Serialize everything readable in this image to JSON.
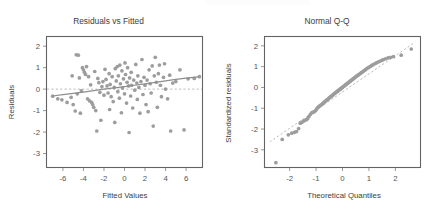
{
  "figure": {
    "background": "#ffffff",
    "point_color": "#9d9d9d",
    "line_color": "#8e8e8e",
    "ref_line_color": "#b4b4b4",
    "frame_color": "#636363"
  },
  "chart_data": [
    {
      "type": "scatter",
      "panel": "left",
      "title": "Residuals vs Fitted",
      "xlabel": "Fitted Values",
      "ylabel": "Residuals",
      "xlim": [
        -7.6,
        7.6
      ],
      "ylim": [
        -3.65,
        2.45
      ],
      "xticks": [
        -6,
        -4,
        -2,
        0,
        2,
        4,
        6
      ],
      "xtick_labels": [
        "-6",
        "-4",
        "-2",
        "0",
        "2",
        "4",
        "6"
      ],
      "yticks": [
        2,
        1,
        0,
        -1,
        -2,
        -3
      ],
      "ytick_labels": [
        "2",
        "1",
        "0",
        "-1",
        "-2",
        "-3"
      ],
      "grid": false,
      "legend": null,
      "reference_line": {
        "type": "horizontal",
        "y": 0,
        "style": "dashed"
      },
      "trend_line": {
        "type": "loess",
        "style": "solid",
        "x": [
          -7.0,
          -6.0,
          -5.0,
          -4.0,
          -3.0,
          -2.0,
          -1.0,
          0.0,
          1.0,
          2.0,
          3.0,
          4.0,
          5.0,
          6.0,
          7.2
        ],
        "y": [
          -0.32,
          -0.26,
          -0.2,
          -0.14,
          -0.07,
          0.0,
          0.06,
          0.12,
          0.18,
          0.24,
          0.31,
          0.38,
          0.45,
          0.51,
          0.57
        ]
      },
      "points": [
        [
          -7.0,
          -0.33
        ],
        [
          -6.5,
          -0.45
        ],
        [
          -6.1,
          -0.5
        ],
        [
          -5.6,
          -0.62
        ],
        [
          -5.2,
          -0.38
        ],
        [
          -5.1,
          0.62
        ],
        [
          -5.0,
          -0.72
        ],
        [
          -4.8,
          -1.02
        ],
        [
          -4.7,
          1.6
        ],
        [
          -4.6,
          -0.22
        ],
        [
          -4.5,
          1.58
        ],
        [
          -4.4,
          0.52
        ],
        [
          -4.3,
          -1.12
        ],
        [
          -4.2,
          -0.08
        ],
        [
          -4.1,
          1.0
        ],
        [
          -4.0,
          0.9
        ],
        [
          -3.9,
          0.78
        ],
        [
          -3.8,
          0.68
        ],
        [
          -3.7,
          1.05
        ],
        [
          -3.6,
          -0.45
        ],
        [
          -3.5,
          0.58
        ],
        [
          -3.4,
          -0.55
        ],
        [
          -3.3,
          0.2
        ],
        [
          -3.2,
          -0.62
        ],
        [
          -3.1,
          -0.72
        ],
        [
          -3.0,
          -0.85
        ],
        [
          -2.9,
          0.82
        ],
        [
          -2.8,
          -1.0
        ],
        [
          -2.7,
          -1.95
        ],
        [
          -2.6,
          0.5
        ],
        [
          -2.5,
          0.3
        ],
        [
          -2.4,
          -0.15
        ],
        [
          -2.3,
          -1.45
        ],
        [
          -2.2,
          0.12
        ],
        [
          -2.1,
          0.35
        ],
        [
          -2.0,
          -0.28
        ],
        [
          -1.9,
          0.92
        ],
        [
          -1.8,
          0.45
        ],
        [
          -1.7,
          0.15
        ],
        [
          -1.6,
          -0.18
        ],
        [
          -1.5,
          0.72
        ],
        [
          -1.45,
          -0.95
        ],
        [
          -1.4,
          0.22
        ],
        [
          -1.3,
          -0.35
        ],
        [
          -1.2,
          0.58
        ],
        [
          -1.1,
          -0.58
        ],
        [
          -1.0,
          0.08
        ],
        [
          -0.95,
          -1.55
        ],
        [
          -0.9,
          0.95
        ],
        [
          -0.8,
          0.38
        ],
        [
          -0.7,
          1.05
        ],
        [
          -0.65,
          -0.12
        ],
        [
          -0.6,
          0.62
        ],
        [
          -0.5,
          -0.42
        ],
        [
          -0.45,
          1.12
        ],
        [
          -0.4,
          0.25
        ],
        [
          -0.3,
          -1.1
        ],
        [
          -0.25,
          0.85
        ],
        [
          -0.2,
          0.05
        ],
        [
          -0.1,
          0.48
        ],
        [
          0.0,
          -0.22
        ],
        [
          0.05,
          1.22
        ],
        [
          0.1,
          0.68
        ],
        [
          0.2,
          -0.65
        ],
        [
          0.25,
          0.32
        ],
        [
          0.3,
          1.0
        ],
        [
          0.4,
          0.15
        ],
        [
          0.45,
          -2.02
        ],
        [
          0.5,
          0.52
        ],
        [
          0.6,
          -0.32
        ],
        [
          0.65,
          0.78
        ],
        [
          0.7,
          0.18
        ],
        [
          0.8,
          -0.88
        ],
        [
          0.9,
          0.42
        ],
        [
          1.0,
          -0.05
        ],
        [
          1.1,
          1.15
        ],
        [
          1.2,
          0.28
        ],
        [
          1.25,
          -0.48
        ],
        [
          1.3,
          0.62
        ],
        [
          1.4,
          0.08
        ],
        [
          1.5,
          -1.12
        ],
        [
          1.6,
          0.35
        ],
        [
          1.7,
          1.38
        ],
        [
          1.8,
          -0.25
        ],
        [
          1.9,
          0.55
        ],
        [
          2.0,
          0.18
        ],
        [
          2.1,
          -0.72
        ],
        [
          2.2,
          0.42
        ],
        [
          2.3,
          -1.05
        ],
        [
          2.4,
          0.9
        ],
        [
          2.5,
          0.25
        ],
        [
          2.6,
          -0.18
        ],
        [
          2.7,
          1.08
        ],
        [
          2.8,
          -1.72
        ],
        [
          2.9,
          0.62
        ],
        [
          3.0,
          1.48
        ],
        [
          3.1,
          0.32
        ],
        [
          3.2,
          -0.85
        ],
        [
          3.3,
          0.72
        ],
        [
          3.4,
          1.12
        ],
        [
          3.5,
          0.18
        ],
        [
          3.6,
          -0.35
        ],
        [
          3.8,
          0.55
        ],
        [
          3.9,
          1.18
        ],
        [
          4.0,
          0.0
        ],
        [
          4.2,
          -0.45
        ],
        [
          4.4,
          0.65
        ],
        [
          4.5,
          -1.95
        ],
        [
          4.7,
          0.28
        ],
        [
          5.0,
          0.35
        ],
        [
          5.4,
          0.9
        ],
        [
          5.8,
          -1.9
        ],
        [
          6.2,
          0.48
        ],
        [
          6.8,
          0.5
        ],
        [
          7.3,
          0.58
        ]
      ]
    },
    {
      "type": "scatter",
      "panel": "right",
      "title": "Normal Q-Q",
      "xlabel": "Theoretical Quantiles",
      "ylabel": "Standardized residuals",
      "xlim": [
        -2.95,
        2.95
      ],
      "ylim": [
        -3.85,
        2.45
      ],
      "xticks": [
        -2,
        -1,
        0,
        1,
        2
      ],
      "xtick_labels": [
        "-2",
        "-1",
        "0",
        "1",
        "2"
      ],
      "yticks": [
        2,
        1,
        0,
        -1,
        -2,
        -3
      ],
      "ytick_labels": [
        "2",
        "1",
        "0",
        "-1",
        "-2",
        "-3"
      ],
      "grid": false,
      "legend": null,
      "reference_line": {
        "type": "diagonal",
        "style": "dashed",
        "x": [
          -2.75,
          2.75
        ],
        "y": [
          -2.62,
          2.18
        ]
      },
      "points": [
        [
          -2.52,
          -3.62
        ],
        [
          -2.28,
          -2.5
        ],
        [
          -2.05,
          -2.28
        ],
        [
          -1.92,
          -2.2
        ],
        [
          -1.82,
          -2.16
        ],
        [
          -1.74,
          -2.12
        ],
        [
          -1.66,
          -1.98
        ],
        [
          -1.6,
          -1.72
        ],
        [
          -1.54,
          -1.68
        ],
        [
          -1.48,
          -1.62
        ],
        [
          -1.42,
          -1.58
        ],
        [
          -1.37,
          -1.55
        ],
        [
          -1.32,
          -1.5
        ],
        [
          -1.27,
          -1.4
        ],
        [
          -1.22,
          -1.3
        ],
        [
          -1.17,
          -1.22
        ],
        [
          -1.13,
          -1.2
        ],
        [
          -1.09,
          -1.18
        ],
        [
          -1.05,
          -1.15
        ],
        [
          -1.01,
          -1.1
        ],
        [
          -0.97,
          -1.02
        ],
        [
          -0.93,
          -0.96
        ],
        [
          -0.89,
          -0.92
        ],
        [
          -0.86,
          -0.88
        ],
        [
          -0.82,
          -0.85
        ],
        [
          -0.79,
          -0.82
        ],
        [
          -0.75,
          -0.78
        ],
        [
          -0.72,
          -0.74
        ],
        [
          -0.69,
          -0.7
        ],
        [
          -0.66,
          -0.67
        ],
        [
          -0.62,
          -0.63
        ],
        [
          -0.59,
          -0.6
        ],
        [
          -0.56,
          -0.57
        ],
        [
          -0.53,
          -0.54
        ],
        [
          -0.5,
          -0.5
        ],
        [
          -0.47,
          -0.47
        ],
        [
          -0.44,
          -0.44
        ],
        [
          -0.41,
          -0.41
        ],
        [
          -0.38,
          -0.38
        ],
        [
          -0.35,
          -0.35
        ],
        [
          -0.33,
          -0.32
        ],
        [
          -0.3,
          -0.29
        ],
        [
          -0.27,
          -0.26
        ],
        [
          -0.24,
          -0.23
        ],
        [
          -0.21,
          -0.2
        ],
        [
          -0.19,
          -0.18
        ],
        [
          -0.16,
          -0.15
        ],
        [
          -0.13,
          -0.12
        ],
        [
          -0.1,
          -0.09
        ],
        [
          -0.08,
          -0.07
        ],
        [
          -0.05,
          -0.04
        ],
        [
          -0.02,
          -0.01
        ],
        [
          0.0,
          0.01
        ],
        [
          0.03,
          0.04
        ],
        [
          0.06,
          0.07
        ],
        [
          0.08,
          0.09
        ],
        [
          0.11,
          0.12
        ],
        [
          0.14,
          0.15
        ],
        [
          0.17,
          0.18
        ],
        [
          0.19,
          0.2
        ],
        [
          0.22,
          0.23
        ],
        [
          0.25,
          0.26
        ],
        [
          0.28,
          0.29
        ],
        [
          0.31,
          0.32
        ],
        [
          0.34,
          0.35
        ],
        [
          0.37,
          0.38
        ],
        [
          0.4,
          0.41
        ],
        [
          0.43,
          0.44
        ],
        [
          0.46,
          0.47
        ],
        [
          0.49,
          0.5
        ],
        [
          0.53,
          0.54
        ],
        [
          0.56,
          0.57
        ],
        [
          0.6,
          0.6
        ],
        [
          0.63,
          0.63
        ],
        [
          0.67,
          0.67
        ],
        [
          0.71,
          0.71
        ],
        [
          0.75,
          0.74
        ],
        [
          0.79,
          0.78
        ],
        [
          0.83,
          0.82
        ],
        [
          0.87,
          0.86
        ],
        [
          0.91,
          0.9
        ],
        [
          0.96,
          0.94
        ],
        [
          1.01,
          0.98
        ],
        [
          1.06,
          1.02
        ],
        [
          1.11,
          1.06
        ],
        [
          1.16,
          1.1
        ],
        [
          1.22,
          1.14
        ],
        [
          1.28,
          1.18
        ],
        [
          1.34,
          1.22
        ],
        [
          1.41,
          1.26
        ],
        [
          1.48,
          1.3
        ],
        [
          1.55,
          1.34
        ],
        [
          1.63,
          1.38
        ],
        [
          1.72,
          1.42
        ],
        [
          1.82,
          1.45
        ],
        [
          1.93,
          1.48
        ],
        [
          2.22,
          1.55
        ],
        [
          2.6,
          1.85
        ]
      ]
    }
  ]
}
